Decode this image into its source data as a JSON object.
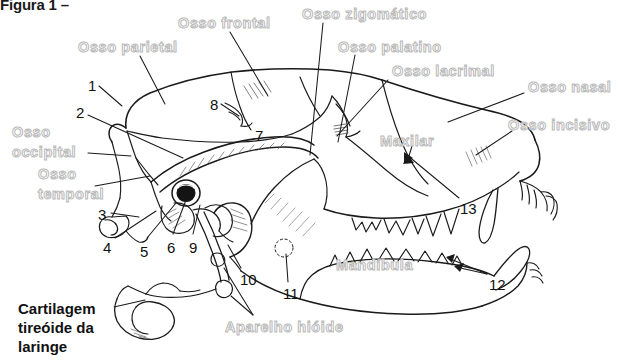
{
  "figure": {
    "title": "Figura 1 –",
    "colors": {
      "label_stroke": "#b9b9b9",
      "label_fill": "#ffffff",
      "text": "#111111",
      "line": "#1a1a1a",
      "background": "#ffffff"
    }
  },
  "anatomical_labels": [
    {
      "id": "osso-parietal",
      "text": "Osso parietal",
      "x": 78,
      "y": 38
    },
    {
      "id": "osso-frontal",
      "text": "Osso frontal",
      "x": 178,
      "y": 14
    },
    {
      "id": "osso-zigomatico",
      "text": "Osso zigomático",
      "x": 302,
      "y": 5
    },
    {
      "id": "osso-palatino",
      "text": "Osso palatino",
      "x": 338,
      "y": 38
    },
    {
      "id": "osso-lacrimal",
      "text": "Osso lacrimal",
      "x": 392,
      "y": 62
    },
    {
      "id": "osso-nasal",
      "text": "Osso nasal",
      "x": 528,
      "y": 78
    },
    {
      "id": "osso-incisivo",
      "text": "Osso incisivo",
      "x": 508,
      "y": 116
    },
    {
      "id": "maxilar",
      "text": "Maxilar",
      "x": 380,
      "y": 132
    },
    {
      "id": "mandibula",
      "text": "Mandíbula",
      "x": 336,
      "y": 256
    },
    {
      "id": "aparelho-hioide",
      "text": "Aparelho hióide",
      "x": 225,
      "y": 318
    }
  ],
  "anatomical_labels_multiline": [
    {
      "id": "osso-occipital",
      "line1": "Osso",
      "line2": "occipital",
      "x": 12,
      "y": 122
    },
    {
      "id": "osso-temporal",
      "line1": "Osso",
      "line2": "temporal",
      "x": 38,
      "y": 164
    }
  ],
  "bold_labels": [
    {
      "id": "cartilagem-tireoide",
      "line1": "Cartilagem",
      "line2": "tireóide da",
      "line3": "laringe",
      "x": 18,
      "y": 299
    }
  ],
  "number_labels": [
    {
      "id": "num-1",
      "text": "1",
      "x": 88,
      "y": 78
    },
    {
      "id": "num-2",
      "text": "2",
      "x": 76,
      "y": 105
    },
    {
      "id": "num-3",
      "text": "3",
      "x": 98,
      "y": 207
    },
    {
      "id": "num-4",
      "text": "4",
      "x": 103,
      "y": 240
    },
    {
      "id": "num-5",
      "text": "5",
      "x": 140,
      "y": 244
    },
    {
      "id": "num-6",
      "text": "6",
      "x": 167,
      "y": 240
    },
    {
      "id": "num-7",
      "text": "7",
      "x": 255,
      "y": 128
    },
    {
      "id": "num-8",
      "text": "8",
      "x": 210,
      "y": 97
    },
    {
      "id": "num-9",
      "text": "9",
      "x": 189,
      "y": 240
    },
    {
      "id": "num-10",
      "text": "10",
      "x": 240,
      "y": 272
    },
    {
      "id": "num-11",
      "text": "11",
      "x": 283,
      "y": 286
    },
    {
      "id": "num-12",
      "text": "12",
      "x": 489,
      "y": 277
    },
    {
      "id": "num-13",
      "text": "13",
      "x": 460,
      "y": 201
    }
  ]
}
